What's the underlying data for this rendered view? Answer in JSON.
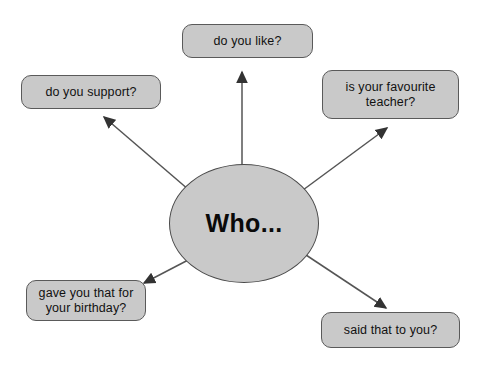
{
  "diagram": {
    "background_color": "#ffffff",
    "node_fill_color": "#c9c9c9",
    "node_border_color": "#5a5a5a",
    "text_color": "#111111",
    "arrow_color": "#555555",
    "center": {
      "label": "Who...",
      "shape": "ellipse"
    },
    "branches": [
      {
        "id": "do-you-like",
        "label": "do you like?",
        "position": "top"
      },
      {
        "id": "do-you-support",
        "label": "do you support?",
        "position": "top-left"
      },
      {
        "id": "is-your-favourite-teacher",
        "label": "is your favourite\nteacher?",
        "position": "top-right"
      },
      {
        "id": "gave-you-that-for-your-birthday",
        "label": "gave you that for\nyour birthday?",
        "position": "bottom-left"
      },
      {
        "id": "said-that-to-you",
        "label": "said that to you?",
        "position": "bottom-right"
      }
    ]
  }
}
